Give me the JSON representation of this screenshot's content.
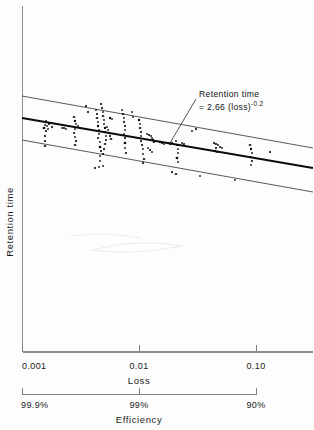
{
  "figure": {
    "background_color": "#fdfdfd",
    "ink_color": "#111111",
    "axis_color": "#8e8e8e"
  },
  "annotation": {
    "line1": "Retention time",
    "line2_prefix": "= 2.66 (loss)",
    "line2_exponent": "-0.2"
  },
  "axes": {
    "y_title": "Retention time",
    "x_primary_title": "Loss",
    "x_secondary_title": "Efficiency",
    "x_primary_ticks": [
      "0.001",
      "0.01",
      "0.10"
    ],
    "x_secondary_ticks": [
      "99.9%",
      "99%",
      "90%"
    ]
  },
  "chart_data": {
    "type": "scatter",
    "title": "",
    "xlabel": "Loss",
    "ylabel": "Retention time",
    "secondary_xlabel": "Efficiency",
    "xscale": "log",
    "xlim": [
      0.001,
      0.2
    ],
    "x_tick_values": [
      0.001,
      0.01,
      0.1
    ],
    "x_tick_labels": [
      "0.001",
      "0.01",
      "0.10"
    ],
    "secondary_x_tick_labels": [
      "99.9%",
      "99%",
      "90%"
    ],
    "ylim": [
      0,
      1
    ],
    "y_tick_labels": [],
    "grid": false,
    "legend": "none",
    "annotations": [
      {
        "text": "Retention time = 2.66(loss)^-0.2",
        "x": 0.035,
        "leader_to": [
          0.0165,
          0.64
        ]
      }
    ],
    "series": [
      {
        "name": "fit",
        "type": "line",
        "label": "Retention time = 2.66(loss)^-0.2",
        "style": "solid-bold",
        "x": [
          0.001,
          0.2
        ],
        "y_px": [
          118,
          168
        ]
      },
      {
        "name": "upper-bound",
        "type": "line",
        "style": "solid-thin",
        "x": [
          0.001,
          0.2
        ],
        "y_px": [
          96,
          148
        ]
      },
      {
        "name": "lower-bound",
        "type": "line",
        "style": "solid-thin",
        "x": [
          0.001,
          0.2
        ],
        "y_px": [
          140,
          192
        ]
      },
      {
        "name": "measurements",
        "type": "scatter",
        "marker": "dot",
        "points_px": [
          [
            44,
            128
          ],
          [
            45,
            125
          ],
          [
            47,
            126
          ],
          [
            46,
            131
          ],
          [
            48,
            129
          ],
          [
            45,
            136
          ],
          [
            45,
            141
          ],
          [
            45,
            146
          ],
          [
            46,
            121
          ],
          [
            49,
            124
          ],
          [
            52,
            127
          ],
          [
            62,
            128
          ],
          [
            64,
            128
          ],
          [
            66,
            129
          ],
          [
            74,
            117
          ],
          [
            75,
            121
          ],
          [
            76,
            124
          ],
          [
            75,
            129
          ],
          [
            74,
            133
          ],
          [
            75,
            137
          ],
          [
            76,
            141
          ],
          [
            75,
            145
          ],
          [
            78,
            126
          ],
          [
            80,
            128
          ],
          [
            86,
            106
          ],
          [
            88,
            112
          ],
          [
            96,
            110
          ],
          [
            97,
            114
          ],
          [
            97,
            118
          ],
          [
            98,
            122
          ],
          [
            98,
            126
          ],
          [
            99,
            130
          ],
          [
            99,
            134
          ],
          [
            98,
            138
          ],
          [
            100,
            142
          ],
          [
            100,
            147
          ],
          [
            101,
            151
          ],
          [
            100,
            156
          ],
          [
            100,
            161
          ],
          [
            101,
            104
          ],
          [
            102,
            108
          ],
          [
            103,
            112
          ],
          [
            103,
            116
          ],
          [
            104,
            120
          ],
          [
            104,
            124
          ],
          [
            105,
            128
          ],
          [
            105,
            132
          ],
          [
            106,
            136
          ],
          [
            106,
            140
          ],
          [
            105,
            144
          ],
          [
            104,
            149
          ],
          [
            103,
            154
          ],
          [
            107,
            127
          ],
          [
            108,
            130
          ],
          [
            109,
            133
          ],
          [
            110,
            136
          ],
          [
            111,
            139
          ],
          [
            95,
            168
          ],
          [
            99,
            167
          ],
          [
            103,
            166
          ],
          [
            110,
            118
          ],
          [
            112,
            119
          ],
          [
            122,
            110
          ],
          [
            123,
            114
          ],
          [
            124,
            118
          ],
          [
            124,
            122
          ],
          [
            125,
            126
          ],
          [
            125,
            130
          ],
          [
            124,
            134
          ],
          [
            125,
            138
          ],
          [
            125,
            143
          ],
          [
            125,
            148
          ],
          [
            126,
            153
          ],
          [
            132,
            112
          ],
          [
            133,
            117
          ],
          [
            139,
            120
          ],
          [
            140,
            124
          ],
          [
            140,
            128
          ],
          [
            141,
            132
          ],
          [
            141,
            136
          ],
          [
            141,
            141
          ],
          [
            142,
            145
          ],
          [
            143,
            149
          ],
          [
            143,
            154
          ],
          [
            144,
            159
          ],
          [
            143,
            163
          ],
          [
            147,
            134
          ],
          [
            149,
            135
          ],
          [
            151,
            136
          ],
          [
            152,
            138
          ],
          [
            153,
            140
          ],
          [
            154,
            142
          ],
          [
            148,
            148
          ],
          [
            150,
            150
          ],
          [
            152,
            152
          ],
          [
            160,
            142
          ],
          [
            162,
            143
          ],
          [
            164,
            144
          ],
          [
            168,
            143
          ],
          [
            170,
            144
          ],
          [
            172,
            143
          ],
          [
            176,
            141
          ],
          [
            177,
            145
          ],
          [
            178,
            149
          ],
          [
            178,
            153
          ],
          [
            177,
            158
          ],
          [
            178,
            162
          ],
          [
            182,
            143
          ],
          [
            184,
            144
          ],
          [
            192,
            131
          ],
          [
            196,
            129
          ],
          [
            214,
            143
          ],
          [
            216,
            144
          ],
          [
            218,
            145
          ],
          [
            216,
            148
          ],
          [
            215,
            151
          ],
          [
            217,
            152
          ],
          [
            220,
            147
          ],
          [
            222,
            148
          ],
          [
            250,
            145
          ],
          [
            251,
            149
          ],
          [
            252,
            153
          ],
          [
            251,
            157
          ],
          [
            252,
            161
          ],
          [
            251,
            165
          ],
          [
            172,
            172
          ],
          [
            176,
            174
          ],
          [
            200,
            176
          ],
          [
            235,
            180
          ],
          [
            270,
            152
          ]
        ]
      }
    ]
  }
}
